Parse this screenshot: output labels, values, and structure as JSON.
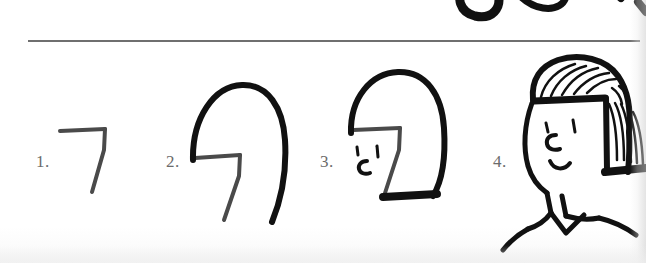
{
  "page": {
    "kind": "scanned-drawing-tutorial-page",
    "width": 646,
    "height": 263,
    "background_color": "#fefefe",
    "ink_color": "#111111",
    "divider_color": "#6f6f6f",
    "label_color": "#6b6b6b"
  },
  "divider": {
    "name": "horizontal-rule"
  },
  "top_partial_row": {
    "description": "partial ink strokes cut off from the drawing row above"
  },
  "steps": [
    {
      "number": "1.",
      "name": "step-1",
      "caption_text": "1.",
      "drawing": "seven-shape: horizontal top stroke with diagonal descending stroke"
    },
    {
      "number": "2.",
      "name": "step-2",
      "caption_text": "2.",
      "drawing": "seven-shape with head outline arc added over it"
    },
    {
      "number": "3.",
      "name": "step-3",
      "caption_text": "3.",
      "drawing": "head outline with eye marks and bottom hair line added"
    },
    {
      "number": "4.",
      "name": "step-4",
      "caption_text": "4.",
      "drawing": "finished face with bob hair strands, eye, nose, smile, neck and shoulders"
    }
  ]
}
